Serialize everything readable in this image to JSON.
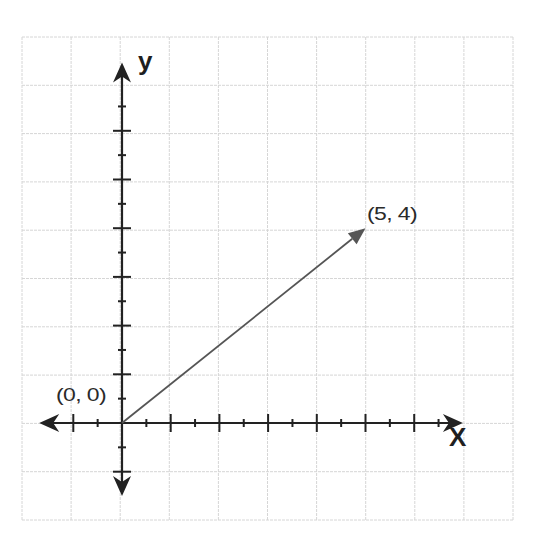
{
  "diagram": {
    "type": "vector-on-coordinate-plane",
    "grid": {
      "left": 22,
      "top": 37,
      "right": 513,
      "bottom": 520,
      "columns": 10,
      "rows": 10,
      "color": "#d6d6d6"
    },
    "axes": {
      "origin_px": [
        122,
        423
      ],
      "unit_px": 48.7,
      "color": "#222222",
      "x_axis": {
        "label": "X",
        "min_units": -1.7,
        "max_units": 7.0
      },
      "y_axis": {
        "label": "y",
        "min_units": -1.5,
        "max_units": 7.4
      }
    },
    "vector": {
      "from": [
        0,
        0
      ],
      "to": [
        5,
        4
      ],
      "color": "#555555"
    },
    "labels": {
      "origin": "(0, 0)",
      "endpoint": "(5, 4)",
      "x": "X",
      "y": "y"
    }
  }
}
